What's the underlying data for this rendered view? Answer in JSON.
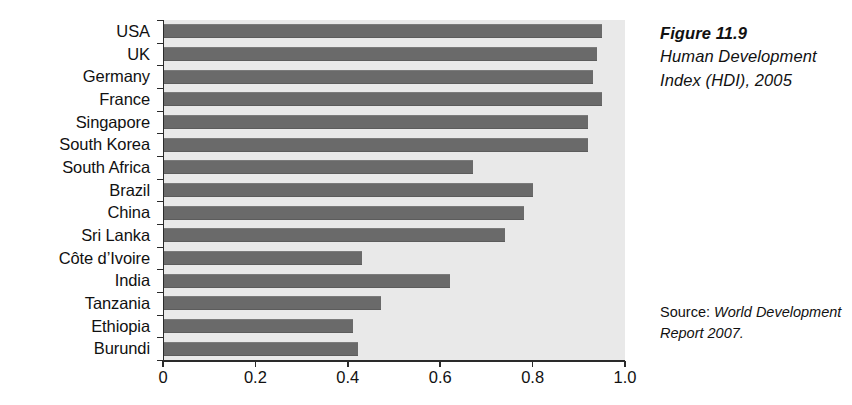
{
  "chart_data": {
    "type": "bar",
    "orientation": "horizontal",
    "title": "Human Development Index (HDI), 2005",
    "figure_number": "Figure 11.9",
    "xlabel": "",
    "ylabel": "",
    "xlim": [
      0,
      1.0
    ],
    "xticks": [
      "0",
      "0.2",
      "0.4",
      "0.6",
      "0.8",
      "1.0"
    ],
    "xtick_values": [
      0,
      0.2,
      0.4,
      0.6,
      0.8,
      1.0
    ],
    "grid": false,
    "legend": "none",
    "bar_color": "#6a6a6a",
    "plot_background": "#e9e9e9",
    "categories": [
      "USA",
      "UK",
      "Germany",
      "France",
      "Singapore",
      "South Korea",
      "South Africa",
      "Brazil",
      "China",
      "Sri Lanka",
      "Côte d’Ivoire",
      "India",
      "Tanzania",
      "Ethiopia",
      "Burundi"
    ],
    "values": [
      0.95,
      0.94,
      0.93,
      0.95,
      0.92,
      0.92,
      0.67,
      0.8,
      0.78,
      0.74,
      0.43,
      0.62,
      0.47,
      0.41,
      0.42
    ]
  },
  "caption": {
    "figure_number": "Figure 11.9",
    "title": "Human Development Index (HDI), 2005"
  },
  "source": {
    "prefix": "Source: ",
    "reference": "World Development Report 2007."
  }
}
